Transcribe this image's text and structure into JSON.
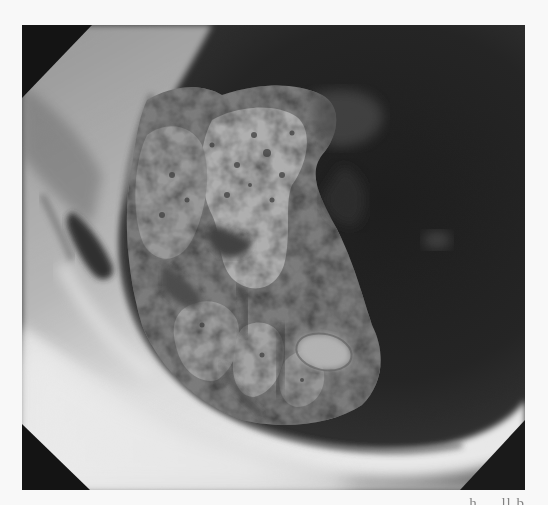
{
  "figure": {
    "kind": "endoscopic photograph",
    "color_mode": "grayscale",
    "caption_fragment": "... h ... ll b"
  },
  "palette": {
    "background": "#f8f8f8",
    "corner_mask": "#141414",
    "lumen_dark": "#1a1a1a",
    "mucosa_bright": "#e8e8e8",
    "lesion_mid": "#8a8a8a",
    "lesion_dark": "#4a4a4a"
  }
}
